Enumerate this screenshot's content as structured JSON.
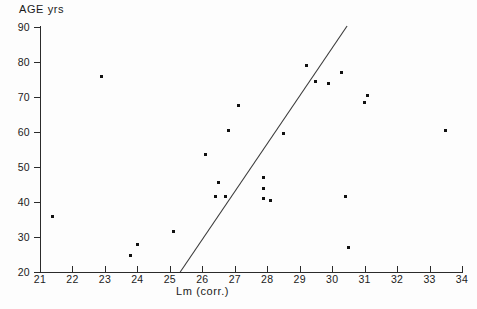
{
  "chart_data": {
    "type": "scatter",
    "title": "",
    "ylabel": "AGE  yrs",
    "xlabel": "Lm (corr.)",
    "xlim": [
      21,
      34
    ],
    "ylim": [
      20,
      90
    ],
    "xticks": [
      21,
      22,
      23,
      24,
      25,
      26,
      27,
      28,
      29,
      30,
      31,
      32,
      33,
      34
    ],
    "yticks": [
      20,
      30,
      40,
      50,
      60,
      70,
      80,
      90
    ],
    "xtick_labels": [
      "21",
      "22",
      "23",
      "24",
      "25",
      "26",
      "27",
      "28",
      "29",
      "30",
      "31",
      "32",
      "33",
      "34"
    ],
    "ytick_labels": [
      "20",
      "30",
      "40",
      "50",
      "60",
      "70",
      "80",
      "90"
    ],
    "grid": false,
    "legend": "none",
    "marker_color": "#111111",
    "axis_color": "#2b2b2b",
    "points": [
      {
        "x": 21.4,
        "y": 36.0
      },
      {
        "x": 22.9,
        "y": 76.0
      },
      {
        "x": 23.8,
        "y": 24.8
      },
      {
        "x": 24.0,
        "y": 27.8
      },
      {
        "x": 25.1,
        "y": 31.5
      },
      {
        "x": 26.1,
        "y": 53.5
      },
      {
        "x": 26.4,
        "y": 41.5
      },
      {
        "x": 26.5,
        "y": 45.5
      },
      {
        "x": 26.7,
        "y": 41.5
      },
      {
        "x": 26.8,
        "y": 60.5
      },
      {
        "x": 27.1,
        "y": 67.5
      },
      {
        "x": 27.9,
        "y": 47.0
      },
      {
        "x": 27.9,
        "y": 44.0
      },
      {
        "x": 27.9,
        "y": 41.0
      },
      {
        "x": 28.1,
        "y": 40.5
      },
      {
        "x": 28.5,
        "y": 59.5
      },
      {
        "x": 29.2,
        "y": 79.0
      },
      {
        "x": 29.5,
        "y": 74.5
      },
      {
        "x": 29.9,
        "y": 74.0
      },
      {
        "x": 30.3,
        "y": 77.0
      },
      {
        "x": 30.4,
        "y": 41.5
      },
      {
        "x": 30.5,
        "y": 27.0
      },
      {
        "x": 31.0,
        "y": 68.5
      },
      {
        "x": 31.1,
        "y": 70.5
      },
      {
        "x": 33.5,
        "y": 60.5
      }
    ],
    "trend_line": {
      "x_start": 25.32,
      "y_start": 20.0,
      "x_end": 30.46,
      "y_end": 90.3
    }
  }
}
